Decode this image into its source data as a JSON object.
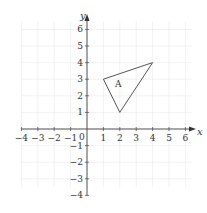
{
  "diagram": {
    "type": "coordinate-plane",
    "axes": {
      "x_label": "x",
      "y_label": "y",
      "origin_label": "0",
      "x_ticks": [
        -4,
        -3,
        -2,
        -1,
        1,
        2,
        3,
        4,
        5,
        6
      ],
      "y_ticks": [
        6,
        5,
        4,
        3,
        2,
        1,
        -1,
        -2,
        -3,
        -4
      ],
      "x_tick_labels": [
        "−4",
        "−3",
        "−2",
        "−1",
        "1",
        "2",
        "3",
        "4",
        "5",
        "6"
      ],
      "y_tick_labels": [
        "6",
        "5",
        "4",
        "3",
        "2",
        "1",
        "−1",
        "−2",
        "−3",
        "−4"
      ]
    },
    "grid": {
      "visible": true,
      "color": "#e8e8e8"
    },
    "colors": {
      "axis": "#555555",
      "shape": "#555555"
    },
    "shapes": [
      {
        "name": "A",
        "type": "triangle",
        "vertices": [
          [
            1,
            3
          ],
          [
            4,
            4
          ],
          [
            2,
            1
          ]
        ],
        "label": "A",
        "label_position": [
          1.9,
          2.7
        ]
      }
    ]
  }
}
